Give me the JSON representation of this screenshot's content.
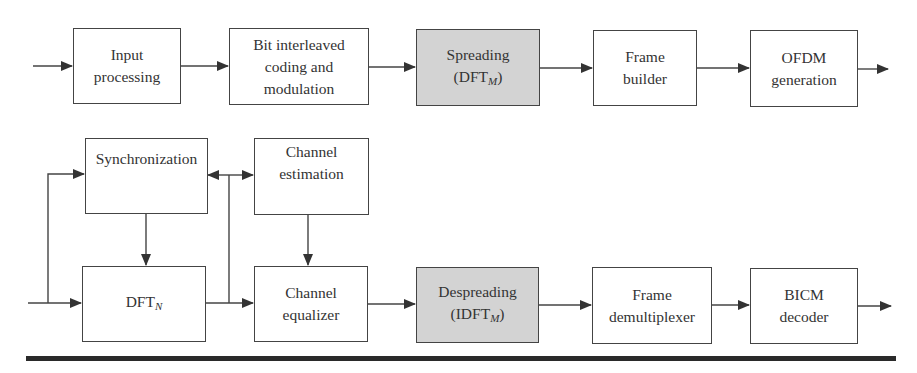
{
  "diagram": {
    "type": "block-diagram",
    "transmitter_chain": [
      {
        "id": "input_processing",
        "lines": [
          "Input",
          "processing"
        ],
        "highlighted": false
      },
      {
        "id": "bicm",
        "lines": [
          "Bit interleaved",
          "coding and",
          "modulation"
        ],
        "highlighted": false
      },
      {
        "id": "spreading",
        "lines": [
          "Spreading",
          "(DFT"
        ],
        "subscript": "M",
        "suffix": ")",
        "highlighted": true
      },
      {
        "id": "frame_builder",
        "lines": [
          "Frame",
          "builder"
        ],
        "highlighted": false
      },
      {
        "id": "ofdm_generation",
        "lines": [
          "OFDM",
          "generation"
        ],
        "highlighted": false
      }
    ],
    "receiver_blocks": [
      {
        "id": "synchronization",
        "lines": [
          "Synchronization"
        ],
        "highlighted": false
      },
      {
        "id": "channel_estimation",
        "lines": [
          "Channel",
          "estimation"
        ],
        "highlighted": false
      },
      {
        "id": "dft_n",
        "lines": [
          "DFT"
        ],
        "subscript": "N",
        "highlighted": false
      },
      {
        "id": "channel_equalizer",
        "lines": [
          "Channel",
          "equalizer"
        ],
        "highlighted": false
      },
      {
        "id": "despreading",
        "lines": [
          "Despreading",
          "(IDFT"
        ],
        "subscript": "M",
        "suffix": ")",
        "highlighted": true
      },
      {
        "id": "frame_demultiplexer",
        "lines": [
          "Frame",
          "demultiplexer"
        ],
        "highlighted": false
      },
      {
        "id": "bicm_decoder",
        "lines": [
          "BICM",
          "decoder"
        ],
        "highlighted": false
      }
    ],
    "colors": {
      "highlight_fill": "#d3d3d3",
      "stroke": "#444444",
      "rule": "#2a2a2a"
    }
  }
}
